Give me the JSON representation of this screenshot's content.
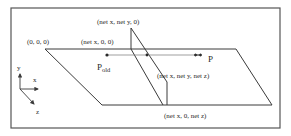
{
  "diagram": {
    "type": "3d-plane-intersection",
    "colors": {
      "line": "#3a3a3a",
      "frame": "#555555",
      "text": "#2a2a2a",
      "background": "#ffffff"
    },
    "labels": {
      "origin": "(0, 0, 0)",
      "net_x_0_0": "(net  x, 0, 0)",
      "net_x_net_y_0": "(net  x, net  y, 0)",
      "net_x_net_y_net_z": "(net  x, net  y, net  z)",
      "net_x_0_net_z": "(net  x, 0, net  z)"
    },
    "points": {
      "p_old_main": "P",
      "p_old_sub": "old",
      "p_new": "P"
    },
    "axes": {
      "x": "x",
      "y": "y",
      "z": "z"
    }
  }
}
